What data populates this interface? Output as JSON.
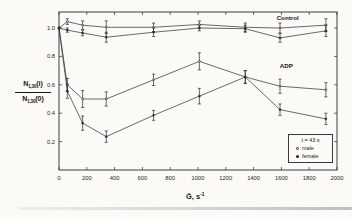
{
  "figure": {
    "region_labels": {
      "control": "Control",
      "adp": "ADP"
    }
  },
  "legend": {
    "title": "t = 43 s",
    "items": [
      {
        "marker": "open-circle",
        "label": "male"
      },
      {
        "marker": "filled-circle",
        "label": "female"
      }
    ]
  },
  "chart_data": {
    "type": "line",
    "x": [
      0,
      60,
      170,
      340,
      680,
      1010,
      1340,
      1590,
      1920
    ],
    "series": [
      {
        "id": "control-upper",
        "group": "Control",
        "marker": "open",
        "y": [
          1.0,
          1.045,
          1.02,
          1.005,
          1.005,
          1.025,
          1.005,
          1.0,
          1.02
        ],
        "err": [
          0,
          0.02,
          0.03,
          0.045,
          0.03,
          0.025,
          0.03,
          0.035,
          0.045
        ]
      },
      {
        "id": "control-lower",
        "group": "Control",
        "marker": "filled",
        "y": [
          1.0,
          0.985,
          0.965,
          0.935,
          0.97,
          1.0,
          0.995,
          0.93,
          0.98
        ],
        "err": [
          0,
          0.015,
          0.02,
          0.035,
          0.03,
          0.02,
          0.025,
          0.03,
          0.04
        ]
      },
      {
        "id": "adp-upper",
        "group": "ADP",
        "marker": "open",
        "y": [
          1.0,
          0.6,
          0.5,
          0.5,
          0.635,
          0.765,
          0.655,
          0.59,
          0.565
        ],
        "err": [
          0,
          0.045,
          0.06,
          0.05,
          0.04,
          0.06,
          0.045,
          0.05,
          0.05
        ]
      },
      {
        "id": "adp-lower",
        "group": "ADP",
        "marker": "filled",
        "y": [
          1.0,
          0.555,
          0.33,
          0.235,
          0.385,
          0.52,
          0.655,
          0.425,
          0.36
        ],
        "err": [
          0,
          0.05,
          0.05,
          0.04,
          0.035,
          0.055,
          0.045,
          0.04,
          0.04
        ]
      }
    ],
    "annotations": [
      {
        "text": "Control",
        "x": 1645,
        "y": 1.055
      },
      {
        "text": "ADP",
        "x": 1635,
        "y": 0.72
      }
    ],
    "xlabel_base": "Ḡ, s",
    "xlabel_sup": "-1",
    "ylabel": {
      "num_base": "N",
      "num_sub": "1,30",
      "num_arg": "(i)",
      "den_base": "N",
      "den_sub": "1,30",
      "den_arg": "(0)"
    },
    "xlim": [
      0,
      2000
    ],
    "ylim": [
      0,
      1.11
    ],
    "xticks": [
      0,
      200,
      400,
      600,
      800,
      1000,
      1200,
      1400,
      1600,
      1800,
      2000
    ],
    "xtick_labels": [
      "0",
      "200",
      "400",
      "600",
      "800",
      "1000",
      "1200",
      "1400",
      "1600",
      "1800",
      "2000"
    ],
    "yticks": [
      0.2,
      0.4,
      0.6,
      0.8,
      1.0
    ],
    "ytick_labels": [
      "0.2",
      "0.4",
      "0.6",
      "0.8",
      "1.0"
    ],
    "grid": false,
    "legend_position": "lower-right",
    "line_color": "#2b2b2b",
    "frame_color": "#2b2b2b"
  }
}
